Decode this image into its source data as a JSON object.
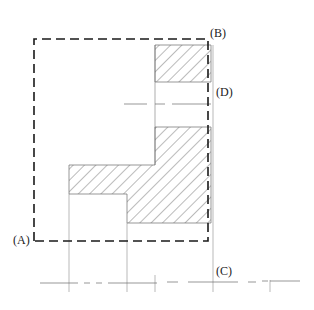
{
  "diagram": {
    "type": "engineering-section-drawing",
    "labels": {
      "A": "(A)",
      "B": "(B)",
      "C": "(C)",
      "D": "(D)"
    },
    "colors": {
      "line": "#1a1a1a",
      "thin_line": "#6a6a6a",
      "hatch": "#555555",
      "background": "#ffffff"
    },
    "dashed_boundary": {
      "x1": 34,
      "y1": 39,
      "x2": 208,
      "y2": 241
    },
    "hatched_regions": [
      {
        "name": "upper-block",
        "points": "155,45 211,45 211,82 155,82"
      },
      {
        "name": "lower-l-section",
        "points": "155,127 211,127 211,223 127,223 127,194 69,194 69,165 155,165"
      }
    ],
    "centerline_d": {
      "x1": 124,
      "x2": 211,
      "y": 104
    },
    "baseline_c": {
      "y": 282,
      "x1": 40,
      "x2": 300
    },
    "vertical_guides": [
      69,
      127,
      155,
      213,
      270
    ]
  }
}
